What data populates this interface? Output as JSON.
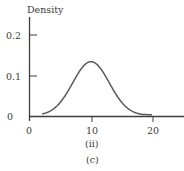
{
  "chart_data": {
    "type": "line",
    "title": "",
    "ylabel": "Density",
    "xlabel": "",
    "subcaption": "(ii)",
    "caption": "(c)",
    "xlim": [
      0,
      25
    ],
    "ylim": [
      0,
      0.25
    ],
    "x_ticks": [
      0,
      10,
      20
    ],
    "x_tick_labels": [
      "0",
      "10",
      "20"
    ],
    "y_ticks": [
      0,
      0.1,
      0.2
    ],
    "y_tick_labels": [
      "0",
      "0.1",
      "0.2"
    ],
    "grid": false,
    "legend": null,
    "series": [
      {
        "name": "Normal density (mean 10, sd 3)",
        "distribution": "normal",
        "mean": 10,
        "sd": 3,
        "x_range": [
          2,
          20
        ],
        "x": [
          2,
          4,
          6,
          8,
          10,
          12,
          14,
          16,
          18,
          20
        ],
        "values": [
          0.004,
          0.018,
          0.055,
          0.107,
          0.133,
          0.107,
          0.055,
          0.018,
          0.004,
          0.001
        ]
      }
    ]
  },
  "labels": {
    "ylabel": "Density",
    "y_tick_0": "0",
    "y_tick_1": "0.1",
    "y_tick_2": "0.2",
    "x_tick_0": "0",
    "x_tick_1": "10",
    "x_tick_2": "20",
    "subcaption": "(ii)",
    "caption": "(c)"
  },
  "colors": {
    "axis": "#3d3d3d",
    "curve": "#5a5a5a",
    "text": "#3a3a3a"
  }
}
